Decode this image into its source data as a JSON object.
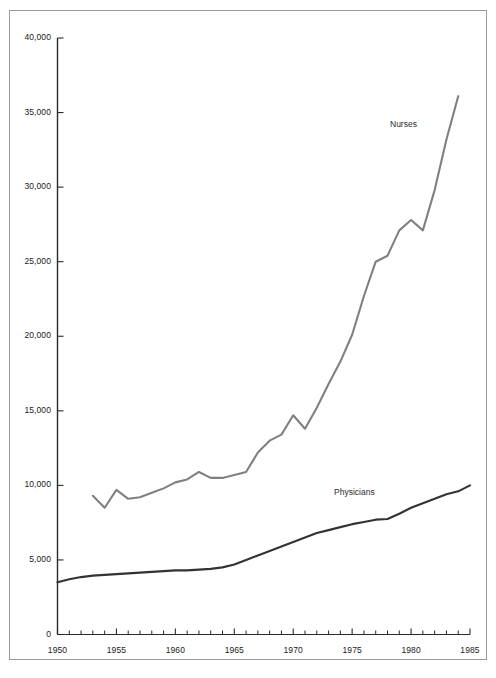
{
  "chart_data": {
    "type": "line",
    "title": "",
    "subtitle": "",
    "xlabel": "",
    "ylabel": "",
    "xlim": [
      1950,
      1985
    ],
    "ylim": [
      0,
      40000
    ],
    "grid": false,
    "legend_position": "inline-annotation",
    "y_ticks": [
      0,
      5000,
      10000,
      15000,
      20000,
      25000,
      30000,
      35000,
      40000
    ],
    "y_tick_labels": [
      "0",
      "5,000",
      "10,000",
      "15,000",
      "20,000",
      "25,000",
      "30,000",
      "35,000",
      "40,000"
    ],
    "x_ticks": [
      1950,
      1955,
      1960,
      1965,
      1970,
      1975,
      1980,
      1985
    ],
    "x_tick_labels": [
      "1950",
      "1955",
      "1960",
      "1965",
      "1970",
      "1975",
      "1980",
      "1985"
    ],
    "x_minor_tick_interval": 1,
    "series": [
      {
        "name": "Nurses",
        "color": "#808080",
        "annotation": "Nurses",
        "x": [
          1953,
          1954,
          1955,
          1956,
          1957,
          1958,
          1959,
          1960,
          1961,
          1962,
          1963,
          1964,
          1965,
          1966,
          1967,
          1968,
          1969,
          1970,
          1971,
          1972,
          1973,
          1974,
          1975,
          1976,
          1977,
          1978,
          1979,
          1980,
          1981,
          1982,
          1983,
          1984
        ],
        "values": [
          9300,
          8500,
          9700,
          9100,
          9200,
          9500,
          9800,
          10200,
          10400,
          10900,
          10500,
          10500,
          10700,
          10900,
          12200,
          13000,
          13400,
          14700,
          13800,
          15200,
          16800,
          18300,
          20100,
          22700,
          25000,
          25400,
          27100,
          27800,
          27100,
          29800,
          33200,
          36100
        ]
      },
      {
        "name": "Physicians",
        "color": "#333333",
        "annotation": "Physicians",
        "x": [
          1950,
          1951,
          1952,
          1953,
          1954,
          1955,
          1956,
          1957,
          1958,
          1959,
          1960,
          1961,
          1962,
          1963,
          1964,
          1965,
          1966,
          1967,
          1968,
          1969,
          1970,
          1971,
          1972,
          1973,
          1974,
          1975,
          1976,
          1977,
          1978,
          1979,
          1980,
          1981,
          1982,
          1983,
          1984,
          1985
        ],
        "values": [
          3500,
          3700,
          3850,
          3950,
          4000,
          4050,
          4100,
          4150,
          4200,
          4250,
          4300,
          4300,
          4350,
          4400,
          4500,
          4700,
          5000,
          5300,
          5600,
          5900,
          6200,
          6500,
          6800,
          7000,
          7200,
          7400,
          7550,
          7700,
          7750,
          8100,
          8500,
          8800,
          9100,
          9400,
          9600,
          10000
        ]
      }
    ],
    "annotations": [
      {
        "text": "Nurses",
        "x_px": 390,
        "y_px": 119
      },
      {
        "text": "Physicians",
        "x_px": 334,
        "y_px": 487
      }
    ]
  },
  "axes": {
    "axis_color": "#2a2a2a",
    "frame_color": "#9a9a9a",
    "background": "#ffffff"
  }
}
